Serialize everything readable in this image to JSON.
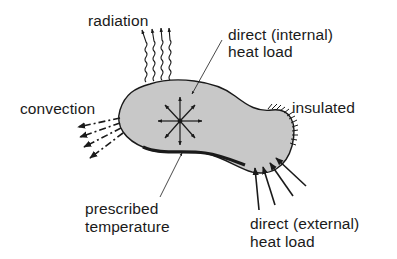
{
  "diagram": {
    "type": "heat-transfer boundary conditions schematic",
    "colors": {
      "body_fill": "#c8c8c8",
      "stroke": "#1a1a1a",
      "background": "#ffffff"
    },
    "labels": {
      "radiation": "radiation",
      "internal_load_line1": "direct (internal)",
      "internal_load_line2": "heat load",
      "convection": "convection",
      "insulated": "insulated",
      "prescribed_line1": "prescribed",
      "prescribed_line2": "temperature",
      "external_load_line1": "direct (external)",
      "external_load_line2": "heat load"
    },
    "elements": [
      {
        "name": "body",
        "shape": "irregular blob"
      },
      {
        "name": "radiation-arrows",
        "count": 4,
        "style": "wavy outward arrows"
      },
      {
        "name": "convection-arrows",
        "count": 4,
        "style": "dash-dot outward arrows"
      },
      {
        "name": "internal-heat-load",
        "style": "8-direction star of arrows"
      },
      {
        "name": "insulated-boundary",
        "style": "hatched edge"
      },
      {
        "name": "prescribed-temperature-boundary",
        "style": "thick edge"
      },
      {
        "name": "external-heat-load-arrows",
        "count": 4,
        "style": "inward arrows"
      }
    ]
  }
}
